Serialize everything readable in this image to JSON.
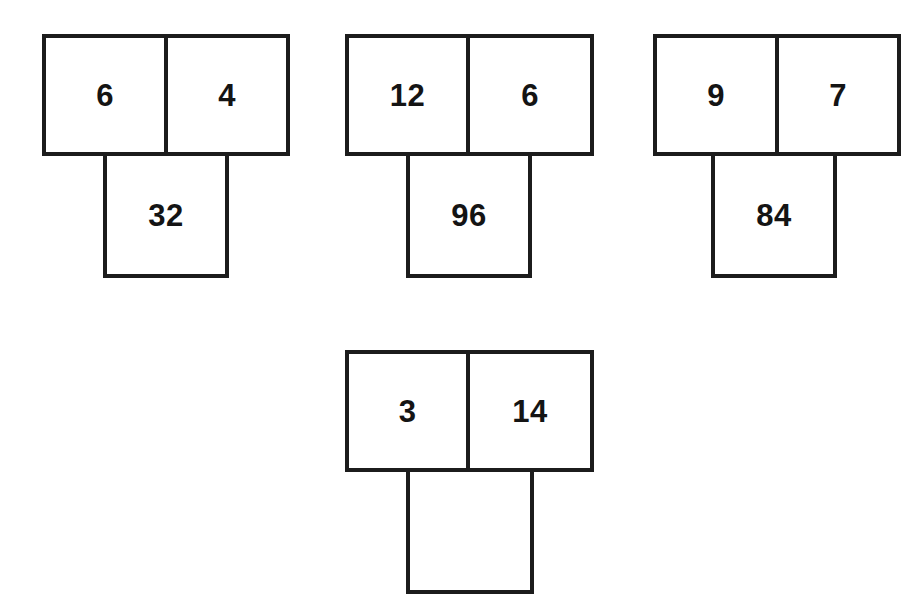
{
  "worksheet": {
    "background_color": "#ffffff",
    "line_color": "#1c1c1c",
    "text_color": "#141414",
    "puzzles": [
      {
        "id": "puzzle-1",
        "top_left_value": "6",
        "top_right_value": "4",
        "answer_value": "32",
        "answer_filled": true
      },
      {
        "id": "puzzle-2",
        "top_left_value": "12",
        "top_right_value": "6",
        "answer_value": "96",
        "answer_filled": true
      },
      {
        "id": "puzzle-3",
        "top_left_value": "9",
        "top_right_value": "7",
        "answer_value": "84",
        "answer_filled": true
      },
      {
        "id": "puzzle-4",
        "top_left_value": "3",
        "top_right_value": "14",
        "answer_value": "",
        "answer_filled": false
      }
    ]
  }
}
